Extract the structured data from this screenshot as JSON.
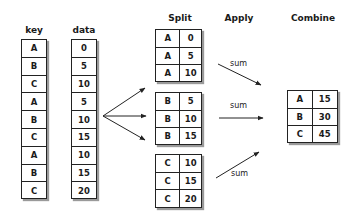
{
  "headers": {
    "key": "key",
    "data": "data",
    "split": "Split",
    "apply": "Apply",
    "combine": "Combine"
  },
  "source": {
    "keys": [
      "A",
      "B",
      "C",
      "A",
      "B",
      "C",
      "A",
      "B",
      "C"
    ],
    "values": [
      "0",
      "5",
      "10",
      "5",
      "10",
      "15",
      "10",
      "15",
      "20"
    ]
  },
  "split": [
    {
      "rows": [
        [
          "A",
          "0"
        ],
        [
          "A",
          "5"
        ],
        [
          "A",
          "10"
        ]
      ]
    },
    {
      "rows": [
        [
          "B",
          "5"
        ],
        [
          "B",
          "10"
        ],
        [
          "B",
          "15"
        ]
      ]
    },
    {
      "rows": [
        [
          "C",
          "10"
        ],
        [
          "C",
          "15"
        ],
        [
          "C",
          "20"
        ]
      ]
    }
  ],
  "apply": {
    "labels": [
      "sum",
      "sum",
      "sum"
    ]
  },
  "combine": {
    "rows": [
      [
        "A",
        "15"
      ],
      [
        "B",
        "30"
      ],
      [
        "C",
        "45"
      ]
    ]
  },
  "colors": {
    "line": "#222222",
    "shadow": "#9a9a9a",
    "background": "#ffffff"
  }
}
